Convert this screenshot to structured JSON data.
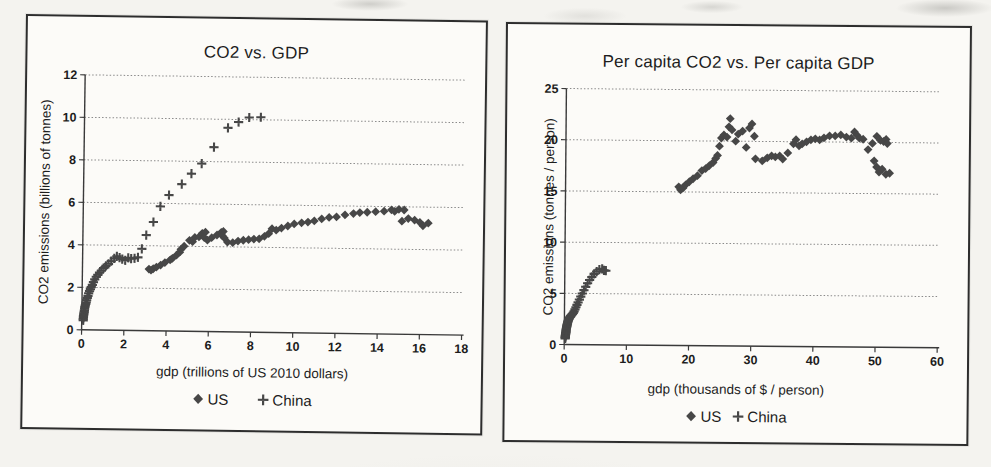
{
  "palette": {
    "marker": "#474747",
    "grid": "#8a8a8a",
    "axis": "#3a3a3a",
    "text": "#1d1d1d",
    "paper": "#f4f3ef",
    "chart_bg": "#fcfbf8",
    "border": "#2d2d2d"
  },
  "chart_data": [
    {
      "type": "scatter",
      "title": "CO2 vs. GDP",
      "xlabel": "gdp (trillions of US 2010 dollars)",
      "ylabel": "CO2 emissions (billions of tonnes)",
      "xlim": [
        0,
        18
      ],
      "ylim": [
        0,
        12
      ],
      "xticks": [
        0,
        2,
        4,
        6,
        8,
        10,
        12,
        14,
        16,
        18
      ],
      "yticks": [
        0,
        2,
        4,
        6,
        8,
        10,
        12
      ],
      "grid": "horizontal-dotted",
      "legend_position": "bottom",
      "series": [
        {
          "name": "US",
          "marker": "diamond",
          "points": [
            [
              3.15,
              2.9
            ],
            [
              3.25,
              2.85
            ],
            [
              3.35,
              2.92
            ],
            [
              3.5,
              3.0
            ],
            [
              3.7,
              3.1
            ],
            [
              3.9,
              3.22
            ],
            [
              4.15,
              3.35
            ],
            [
              4.25,
              3.42
            ],
            [
              4.45,
              3.58
            ],
            [
              4.6,
              3.72
            ],
            [
              4.65,
              3.85
            ],
            [
              4.8,
              4.0
            ],
            [
              5.05,
              4.28
            ],
            [
              5.2,
              4.22
            ],
            [
              5.3,
              4.42
            ],
            [
              5.5,
              4.45
            ],
            [
              5.65,
              4.62
            ],
            [
              5.8,
              4.68
            ],
            [
              5.75,
              4.42
            ],
            [
              5.9,
              4.3
            ],
            [
              6.1,
              4.42
            ],
            [
              6.35,
              4.55
            ],
            [
              6.55,
              4.68
            ],
            [
              6.65,
              4.72
            ],
            [
              6.6,
              4.52
            ],
            [
              6.7,
              4.42
            ],
            [
              6.85,
              4.22
            ],
            [
              7.1,
              4.2
            ],
            [
              7.35,
              4.28
            ],
            [
              7.6,
              4.32
            ],
            [
              7.85,
              4.35
            ],
            [
              8.1,
              4.38
            ],
            [
              8.35,
              4.4
            ],
            [
              8.6,
              4.52
            ],
            [
              8.8,
              4.65
            ],
            [
              8.95,
              4.88
            ],
            [
              9.15,
              4.82
            ],
            [
              9.4,
              4.92
            ],
            [
              9.7,
              5.02
            ],
            [
              10.0,
              5.12
            ],
            [
              10.35,
              5.18
            ],
            [
              10.65,
              5.22
            ],
            [
              10.95,
              5.28
            ],
            [
              11.3,
              5.38
            ],
            [
              11.65,
              5.45
            ],
            [
              12.0,
              5.48
            ],
            [
              12.4,
              5.58
            ],
            [
              12.8,
              5.65
            ],
            [
              13.1,
              5.7
            ],
            [
              13.45,
              5.72
            ],
            [
              13.85,
              5.75
            ],
            [
              14.25,
              5.78
            ],
            [
              14.6,
              5.85
            ],
            [
              14.75,
              5.78
            ],
            [
              14.95,
              5.88
            ],
            [
              15.2,
              5.85
            ],
            [
              15.1,
              5.32
            ],
            [
              15.4,
              5.45
            ],
            [
              15.7,
              5.38
            ],
            [
              15.95,
              5.28
            ],
            [
              16.1,
              5.12
            ],
            [
              16.35,
              5.25
            ]
          ]
        },
        {
          "name": "China",
          "marker": "plus",
          "points": [
            [
              0.07,
              0.45
            ],
            [
              0.07,
              0.52
            ],
            [
              0.08,
              0.58
            ],
            [
              0.08,
              0.65
            ],
            [
              0.09,
              0.72
            ],
            [
              0.1,
              0.78
            ],
            [
              0.11,
              0.85
            ],
            [
              0.12,
              0.92
            ],
            [
              0.13,
              1.0
            ],
            [
              0.14,
              1.08
            ],
            [
              0.16,
              1.15
            ],
            [
              0.18,
              1.22
            ],
            [
              0.2,
              1.3
            ],
            [
              0.22,
              1.4
            ],
            [
              0.25,
              1.5
            ],
            [
              0.28,
              1.6
            ],
            [
              0.31,
              1.72
            ],
            [
              0.35,
              1.82
            ],
            [
              0.39,
              1.92
            ],
            [
              0.43,
              2.02
            ],
            [
              0.48,
              2.12
            ],
            [
              0.53,
              2.25
            ],
            [
              0.59,
              2.38
            ],
            [
              0.66,
              2.5
            ],
            [
              0.73,
              2.6
            ],
            [
              0.81,
              2.7
            ],
            [
              0.9,
              2.8
            ],
            [
              1.0,
              2.92
            ],
            [
              1.11,
              3.02
            ],
            [
              1.23,
              3.12
            ],
            [
              1.36,
              3.25
            ],
            [
              1.5,
              3.38
            ],
            [
              1.62,
              3.48
            ],
            [
              1.75,
              3.42
            ],
            [
              1.88,
              3.35
            ],
            [
              2.02,
              3.3
            ],
            [
              2.16,
              3.42
            ],
            [
              2.3,
              3.38
            ],
            [
              2.46,
              3.4
            ],
            [
              2.62,
              3.45
            ],
            [
              2.8,
              3.85
            ],
            [
              3.0,
              4.5
            ],
            [
              3.33,
              5.12
            ],
            [
              3.65,
              5.86
            ],
            [
              4.05,
              6.4
            ],
            [
              4.65,
              6.92
            ],
            [
              5.1,
              7.42
            ],
            [
              5.58,
              7.9
            ],
            [
              6.15,
              8.68
            ],
            [
              6.8,
              9.6
            ],
            [
              7.3,
              9.88
            ],
            [
              7.8,
              10.1
            ],
            [
              8.35,
              10.12
            ]
          ]
        }
      ]
    },
    {
      "type": "scatter",
      "title": "Per capita CO2 vs. Per capita GDP",
      "xlabel": "gdp (thousands of $ / person)",
      "ylabel": "CO2 emissions (tonnes / person)",
      "xlim": [
        0,
        60
      ],
      "ylim": [
        0,
        25
      ],
      "xticks": [
        0,
        10,
        20,
        30,
        40,
        50,
        60
      ],
      "yticks": [
        0,
        5,
        10,
        15,
        20,
        25
      ],
      "grid": "horizontal-dotted",
      "legend_position": "bottom",
      "series": [
        {
          "name": "US",
          "marker": "diamond",
          "points": [
            [
              18.2,
              15.5
            ],
            [
              18.5,
              15.2
            ],
            [
              18.9,
              15.4
            ],
            [
              19.3,
              15.7
            ],
            [
              19.9,
              16.0
            ],
            [
              20.5,
              16.3
            ],
            [
              21.2,
              16.6
            ],
            [
              21.9,
              17.1
            ],
            [
              22.5,
              17.3
            ],
            [
              23.1,
              17.6
            ],
            [
              23.7,
              17.9
            ],
            [
              24.1,
              18.3
            ],
            [
              24.4,
              18.6
            ],
            [
              24.7,
              19.5
            ],
            [
              25.0,
              20.3
            ],
            [
              25.4,
              20.6
            ],
            [
              25.9,
              20.4
            ],
            [
              26.2,
              21.4
            ],
            [
              26.4,
              22.2
            ],
            [
              26.7,
              21.1
            ],
            [
              27.3,
              20.0
            ],
            [
              27.7,
              20.7
            ],
            [
              28.4,
              21.0
            ],
            [
              29.0,
              19.4
            ],
            [
              29.5,
              21.3
            ],
            [
              29.9,
              21.7
            ],
            [
              30.3,
              20.5
            ],
            [
              30.5,
              18.3
            ],
            [
              31.6,
              18.1
            ],
            [
              32.4,
              18.4
            ],
            [
              33.1,
              18.6
            ],
            [
              33.7,
              18.5
            ],
            [
              34.4,
              18.6
            ],
            [
              34.9,
              18.3
            ],
            [
              35.7,
              18.9
            ],
            [
              36.6,
              19.8
            ],
            [
              37.0,
              20.2
            ],
            [
              37.5,
              19.6
            ],
            [
              38.0,
              19.8
            ],
            [
              38.7,
              20.0
            ],
            [
              39.4,
              20.2
            ],
            [
              40.1,
              20.3
            ],
            [
              40.8,
              20.2
            ],
            [
              41.5,
              20.4
            ],
            [
              42.4,
              20.6
            ],
            [
              43.3,
              20.6
            ],
            [
              44.2,
              20.7
            ],
            [
              45.1,
              20.5
            ],
            [
              45.9,
              20.4
            ],
            [
              46.4,
              21.0
            ],
            [
              46.8,
              20.7
            ],
            [
              47.2,
              20.4
            ],
            [
              47.8,
              20.3
            ],
            [
              48.6,
              19.3
            ],
            [
              49.3,
              19.9
            ],
            [
              50.0,
              20.6
            ],
            [
              50.6,
              20.2
            ],
            [
              51.1,
              20.1
            ],
            [
              51.5,
              20.3
            ],
            [
              51.7,
              19.9
            ],
            [
              49.6,
              18.2
            ],
            [
              50.0,
              17.6
            ],
            [
              50.4,
              17.1
            ],
            [
              50.9,
              17.4
            ],
            [
              51.5,
              16.9
            ],
            [
              52.1,
              17.0
            ]
          ]
        },
        {
          "name": "China",
          "marker": "plus",
          "points": [
            [
              0.15,
              0.6
            ],
            [
              0.16,
              0.68
            ],
            [
              0.17,
              0.75
            ],
            [
              0.18,
              0.82
            ],
            [
              0.19,
              0.9
            ],
            [
              0.2,
              0.98
            ],
            [
              0.21,
              1.05
            ],
            [
              0.23,
              1.12
            ],
            [
              0.25,
              1.2
            ],
            [
              0.27,
              1.28
            ],
            [
              0.29,
              1.38
            ],
            [
              0.31,
              1.48
            ],
            [
              0.34,
              1.58
            ],
            [
              0.37,
              1.7
            ],
            [
              0.4,
              1.8
            ],
            [
              0.43,
              1.9
            ],
            [
              0.47,
              2.0
            ],
            [
              0.51,
              2.1
            ],
            [
              0.55,
              2.2
            ],
            [
              0.6,
              2.3
            ],
            [
              0.65,
              2.4
            ],
            [
              0.71,
              2.48
            ],
            [
              0.77,
              2.56
            ],
            [
              0.84,
              2.64
            ],
            [
              0.92,
              2.7
            ],
            [
              1.0,
              2.78
            ],
            [
              1.09,
              2.85
            ],
            [
              1.19,
              2.92
            ],
            [
              1.3,
              3.0
            ],
            [
              1.42,
              3.1
            ],
            [
              1.55,
              3.25
            ],
            [
              1.69,
              3.45
            ],
            [
              1.84,
              3.65
            ],
            [
              2.0,
              3.88
            ],
            [
              2.18,
              4.12
            ],
            [
              2.38,
              4.4
            ],
            [
              2.6,
              4.7
            ],
            [
              2.84,
              5.0
            ],
            [
              3.1,
              5.32
            ],
            [
              3.38,
              5.65
            ],
            [
              3.68,
              6.0
            ],
            [
              4.0,
              6.32
            ],
            [
              4.35,
              6.62
            ],
            [
              4.72,
              6.92
            ],
            [
              5.12,
              7.15
            ],
            [
              5.55,
              7.35
            ],
            [
              6.0,
              7.42
            ],
            [
              6.3,
              7.28
            ],
            [
              6.6,
              7.25
            ]
          ]
        }
      ]
    }
  ]
}
